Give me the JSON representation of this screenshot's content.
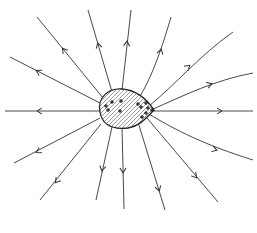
{
  "diagram": {
    "colors": {
      "background": "#ffffff",
      "line": "#333333",
      "outline": "#222222"
    },
    "conductor": {
      "shape": "teardrop",
      "fill_pattern": "diagonal-hatch",
      "charge_symbol": "+",
      "charge_positions": [
        [
          112,
          102
        ],
        [
          121,
          101
        ],
        [
          106,
          106
        ],
        [
          108,
          110
        ],
        [
          120,
          111
        ],
        [
          138,
          104
        ],
        [
          141,
          107
        ],
        [
          146,
          103
        ],
        [
          142,
          117
        ],
        [
          146,
          113
        ],
        [
          148,
          108
        ],
        [
          152,
          110
        ]
      ]
    },
    "field_lines": [
      {
        "id": "left-horizontal",
        "d": "M100,111 L5,111",
        "arrow": [
          38,
          111
        ],
        "angle": 180
      },
      {
        "id": "upper-left-1",
        "d": "M100,103 L10,57",
        "arrow": [
          37,
          71
        ],
        "angle": 207
      },
      {
        "id": "upper-left-2",
        "d": "M103,98 L37,17",
        "arrow": [
          63,
          49
        ],
        "angle": 231
      },
      {
        "id": "up-1",
        "d": "M112,92 L88,10",
        "arrow": [
          98,
          44
        ],
        "angle": 254
      },
      {
        "id": "up-2",
        "d": "M122,90 L131,10",
        "arrow": [
          127,
          42
        ],
        "angle": 276
      },
      {
        "id": "up-right-curve",
        "d": "M140,96 C150,80 160,55 171,17",
        "arrow": [
          161,
          50
        ],
        "angle": 286
      },
      {
        "id": "right-curve-1",
        "d": "M149,106 C175,85 200,55 233,32",
        "arrow": [
          189,
          66
        ],
        "angle": 320
      },
      {
        "id": "right-curve-2",
        "d": "M151,110 C185,95 215,80 253,73",
        "arrow": [
          211,
          84
        ],
        "angle": 340
      },
      {
        "id": "right-horizontal",
        "d": "M151,111 L253,111",
        "arrow": [
          221,
          111
        ],
        "angle": 0
      },
      {
        "id": "right-lower-curve",
        "d": "M149,114 C175,130 205,145 253,160",
        "arrow": [
          216,
          150
        ],
        "angle": 18
      },
      {
        "id": "lower-right",
        "d": "M147,118 L218,202",
        "arrow": [
          196,
          177
        ],
        "angle": 50
      },
      {
        "id": "lower-middle",
        "d": "M138,122 L165,210",
        "arrow": [
          159,
          190
        ],
        "angle": 73
      },
      {
        "id": "lower-1",
        "d": "M122,127 L124,209",
        "arrow": [
          123,
          172
        ],
        "angle": 89
      },
      {
        "id": "lower-2",
        "d": "M112,127 L96,200",
        "arrow": [
          102,
          170
        ],
        "angle": 102
      },
      {
        "id": "lower-left",
        "d": "M101,124 L40,200",
        "arrow": [
          56,
          182
        ],
        "angle": 129
      },
      {
        "id": "left-lower",
        "d": "M100,118 L14,163",
        "arrow": [
          37,
          152
        ],
        "angle": 152
      }
    ]
  }
}
